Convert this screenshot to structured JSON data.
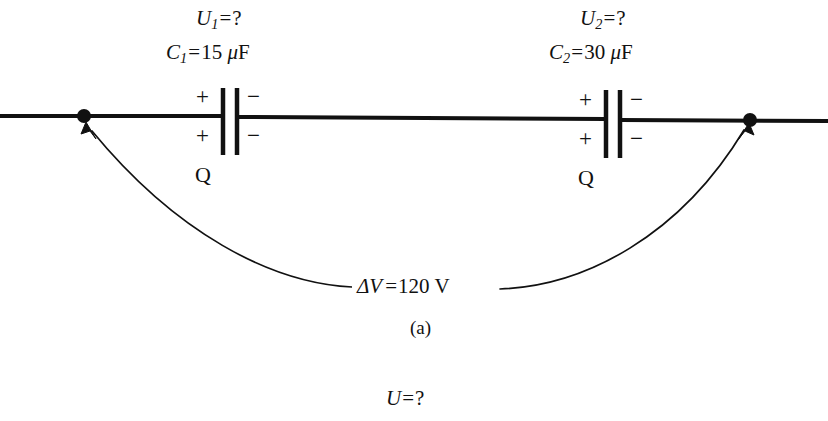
{
  "figure": {
    "caption": "(a)",
    "bottom_label": {
      "variable": "U",
      "equals": "=",
      "value": "?"
    }
  },
  "colors": {
    "ink": "#111111",
    "background": "#ffffff"
  },
  "circuit": {
    "type": "series-capacitor-circuit",
    "wire_label": "horizontal conductor",
    "source": {
      "symbol": "ΔV",
      "equals": "=",
      "value": "120",
      "unit": "V",
      "full_text": "ΔV = 120 V"
    },
    "nodes": [
      {
        "name": "left-terminal",
        "x": 84,
        "y": 116
      },
      {
        "name": "right-terminal",
        "x": 750,
        "y": 120
      }
    ],
    "capacitors": [
      {
        "id": "c1",
        "voltage_label": {
          "variable": "U",
          "subscript": "1",
          "equals": "=",
          "value": "?",
          "full_text": "U1 = ?"
        },
        "capacitance_label": {
          "variable": "C",
          "subscript": "1",
          "equals": "=",
          "value": "15",
          "unit_prefix": "μ",
          "unit": "F",
          "full_text": "C1 = 15 μF"
        },
        "plate_positive_top": "+",
        "plate_positive_bottom": "+",
        "plate_negative_top": "−",
        "plate_negative_bottom": "−",
        "charge_label": "Q"
      },
      {
        "id": "c2",
        "voltage_label": {
          "variable": "U",
          "subscript": "2",
          "equals": "=",
          "value": "?",
          "full_text": "U2 = ?"
        },
        "capacitance_label": {
          "variable": "C",
          "subscript": "2",
          "equals": "=",
          "value": "30",
          "unit_prefix": "μ",
          "unit": "F",
          "full_text": "C2 = 30 μF"
        },
        "plate_positive_top": "+",
        "plate_positive_bottom": "+",
        "plate_negative_top": "−",
        "plate_negative_bottom": "−",
        "charge_label": "Q"
      }
    ]
  }
}
